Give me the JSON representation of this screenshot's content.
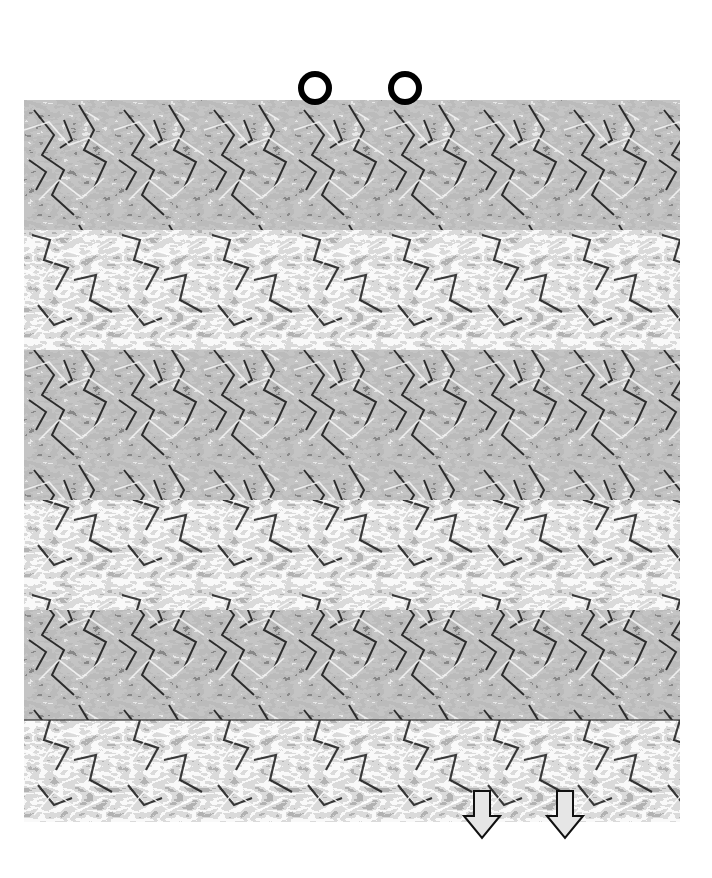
{
  "image": {
    "kind": "autostereogram",
    "description": "Grayscale repeating pattern autostereogram with hidden 3D image",
    "pattern_period_px": 90,
    "colors": {
      "background": "#ffffff",
      "pattern_dark": "#111111",
      "pattern_mid": "#8c8c8c",
      "pattern_light": "#f0f0f0",
      "marker": "#000000",
      "arrow_fill": "#e6e6e6"
    }
  },
  "markers": {
    "top": [
      {
        "icon": "ring-icon",
        "x": 315,
        "y": 88
      },
      {
        "icon": "ring-icon",
        "x": 405,
        "y": 88
      }
    ],
    "bottom": [
      {
        "icon": "down-arrow-icon",
        "x": 482,
        "y": 812
      },
      {
        "icon": "down-arrow-icon",
        "x": 565,
        "y": 812
      }
    ]
  }
}
